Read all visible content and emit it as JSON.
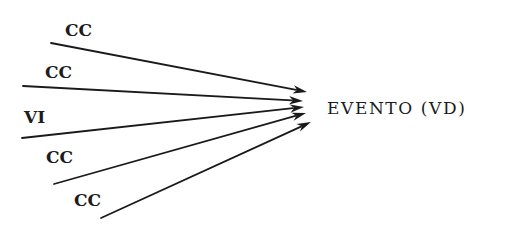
{
  "diagram": {
    "type": "convergent-arrows",
    "target": {
      "label": "EVENTO (VD)",
      "x": 327,
      "y": 114
    },
    "sources": [
      {
        "label": "CC",
        "label_x": 65,
        "label_y": 36,
        "line_start": [
          51,
          43
        ],
        "line_end": [
          307,
          92
        ]
      },
      {
        "label": "CC",
        "label_x": 45,
        "label_y": 78,
        "line_start": [
          23,
          86
        ],
        "line_end": [
          303,
          101
        ]
      },
      {
        "label": "VI",
        "label_x": 24,
        "label_y": 123,
        "line_start": [
          22,
          138
        ],
        "line_end": [
          304,
          107
        ]
      },
      {
        "label": "CC",
        "label_x": 46,
        "label_y": 163,
        "line_start": [
          54,
          184
        ],
        "line_end": [
          306,
          113
        ]
      },
      {
        "label": "CC",
        "label_x": 74,
        "label_y": 206,
        "line_start": [
          101,
          218
        ],
        "line_end": [
          311,
          122
        ]
      }
    ],
    "colors": {
      "ink": "#1a1a1a",
      "background": "#ffffff"
    }
  }
}
